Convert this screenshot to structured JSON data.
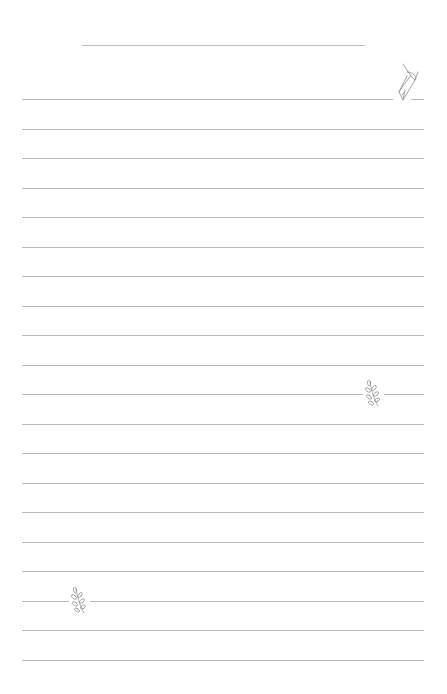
{
  "page": {
    "background": "#ffffff",
    "line_color": "#b9b9b9",
    "ornament_color": "#8a8a8a"
  },
  "title_line": {
    "x1": 82,
    "x2": 365,
    "y": 45
  },
  "ruled_lines": {
    "count": 20,
    "x1": 22,
    "x2": 424,
    "first_y": 99,
    "spacing": 29.5
  },
  "ornaments": [
    {
      "type": "fountain-pen-nib",
      "line_index": 0,
      "cx": 404,
      "gap": [
        393,
        411
      ]
    },
    {
      "type": "leaf-sprig",
      "line_index": 10,
      "cx": 373,
      "gap": [
        363,
        384
      ]
    },
    {
      "type": "leaf-sprig",
      "line_index": 17,
      "cx": 79,
      "gap": [
        69,
        90
      ]
    }
  ]
}
